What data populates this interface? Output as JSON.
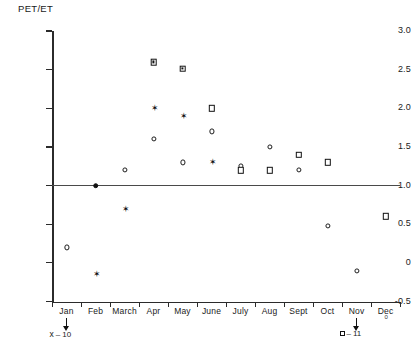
{
  "chart_data": {
    "type": "scatter",
    "title": "",
    "xlabel": "",
    "ylabel": "PET/ET",
    "ylim": [
      -0.5,
      3.0
    ],
    "grid": false,
    "legend_position": "below-axis",
    "x_tick_labels": [
      "Jan",
      "Feb",
      "March",
      "Apr",
      "May",
      "June",
      "July",
      "Aug",
      "Sept",
      "Oct",
      "Nov",
      "Dec"
    ],
    "y_tick_labels": [
      "3.0",
      "2.5",
      "2.0",
      "1.5",
      "1.0",
      "0.5",
      "0",
      "-0.5"
    ],
    "y_tick_values": [
      3.0,
      2.5,
      2.0,
      1.5,
      1.0,
      0.5,
      0.0,
      -0.5
    ],
    "reference_line": {
      "value": 1.0,
      "orientation": "horizontal"
    },
    "series": [
      {
        "name": "circle",
        "marker": "open-circle",
        "points": [
          {
            "x": "Jan",
            "y": 0.2
          },
          {
            "x": "Apr",
            "y": 1.6
          },
          {
            "x": "March",
            "y": 1.2
          },
          {
            "x": "June",
            "y": 1.7
          },
          {
            "x": "May",
            "y": 1.3
          },
          {
            "x": "July",
            "y": 1.25
          },
          {
            "x": "Aug",
            "y": 1.5
          },
          {
            "x": "Sept",
            "y": 1.2
          },
          {
            "x": "Oct",
            "y": 0.48
          },
          {
            "x": "Nov",
            "y": -0.1
          }
        ]
      },
      {
        "name": "filled-circle",
        "marker": "filled-circle",
        "points": [
          {
            "x": "Feb",
            "y": 1.0
          }
        ]
      },
      {
        "name": "star",
        "marker": "star",
        "points": [
          {
            "x": "Feb",
            "y": -0.15
          },
          {
            "x": "March",
            "y": 0.7
          },
          {
            "x": "Apr",
            "y": 2.0
          },
          {
            "x": "May",
            "y": 1.9
          },
          {
            "x": "June",
            "y": 1.3
          }
        ]
      },
      {
        "name": "square",
        "marker": "open-square",
        "points": [
          {
            "x": "Apr",
            "y": 2.6
          },
          {
            "x": "May",
            "y": 2.6
          },
          {
            "x": "June",
            "y": 2.0
          },
          {
            "x": "July",
            "y": 1.2
          },
          {
            "x": "Aug",
            "y": 1.2
          },
          {
            "x": "Sept",
            "y": 1.4
          },
          {
            "x": "Oct",
            "y": 1.3
          },
          {
            "x": "Dec",
            "y": 0.6
          }
        ]
      }
    ],
    "annotations": [
      {
        "id": "ann-jan",
        "symbol": "x",
        "text": "10",
        "label": "x – 10",
        "at": "Jan"
      },
      {
        "id": "ann-nov",
        "symbol": "square",
        "text": "11",
        "label": "□ – 11",
        "at": "Nov"
      }
    ],
    "dec_subscript": "0"
  }
}
